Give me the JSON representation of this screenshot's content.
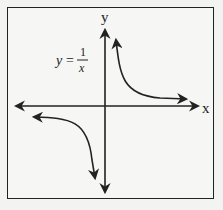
{
  "diagram": {
    "equation": {
      "lhs": "y",
      "equals": "=",
      "numerator": "1",
      "denominator": "x"
    },
    "axes": {
      "x_label": "x",
      "y_label": "y"
    },
    "curves": [
      {
        "name": "branch-quadrant-1",
        "description": "Upper right branch approaching y-axis upward and x-axis rightward"
      },
      {
        "name": "branch-quadrant-3",
        "description": "Lower left branch approaching x-axis leftward and y-axis downward"
      }
    ],
    "colors": {
      "line": "#222222",
      "background": "#f6f6f4"
    }
  }
}
